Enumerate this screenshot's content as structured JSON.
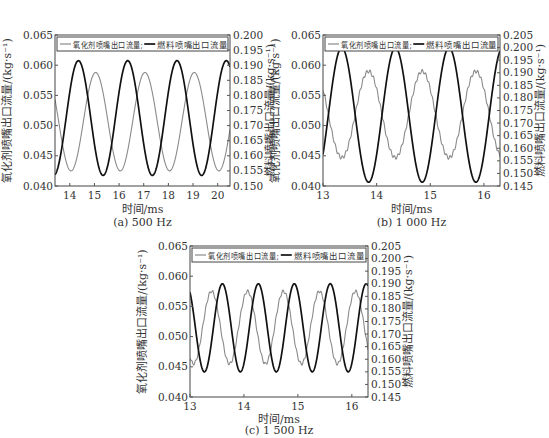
{
  "colors": {
    "oxidizer": "#8a8a8a",
    "fuel": "#111111",
    "axis": "#555555",
    "frame": "#444444"
  },
  "legend": {
    "oxidizer": "氧化剂喷嘴出口流量;",
    "fuel": "燃料喷嘴出口流量"
  },
  "axis_titles": {
    "x": "时间/ms",
    "y_left": "氧化剂喷嘴出口流量/(kg·s⁻¹)",
    "y_right": "燃料喷嘴出口流量/(kg·s⁻¹)"
  },
  "panels": [
    {
      "caption": "(a)  500 Hz"
    },
    {
      "caption": "(b)  1 000 Hz"
    },
    {
      "caption": "(c)  1 500 Hz"
    }
  ],
  "chart_data": [
    {
      "type": "line",
      "title": "(a) 500 Hz",
      "xlabel": "时间/ms",
      "ylabel": "氧化剂喷嘴出口流量/(kg·s⁻¹)",
      "ylabel_right": "燃料喷嘴出口流量/(kg·s⁻¹)",
      "xlim": [
        13.4,
        20.5
      ],
      "xticks": [
        14,
        15,
        16,
        17,
        18,
        19,
        20
      ],
      "ylim": [
        0.04,
        0.065
      ],
      "yticks": [
        0.04,
        0.045,
        0.05,
        0.055,
        0.06,
        0.065
      ],
      "ylim_right": [
        0.15,
        0.2
      ],
      "yticks_right": [
        0.15,
        0.155,
        0.16,
        0.165,
        0.17,
        0.175,
        0.18,
        0.185,
        0.19,
        0.195,
        0.2
      ],
      "legend_position": "top inside",
      "grid": false,
      "series": [
        {
          "name": "氧化剂喷嘴出口流量",
          "axis": "left",
          "frequency_hz": 500,
          "min": 0.0425,
          "max": 0.0588,
          "peaks_ms": [
            15.05,
            17.05,
            19.05
          ]
        },
        {
          "name": "燃料喷嘴出口流量",
          "axis": "right",
          "frequency_hz": 500,
          "min": 0.1535,
          "max": 0.1915,
          "peaks_ms": [
            14.35,
            16.35,
            18.35,
            20.35
          ]
        }
      ]
    },
    {
      "type": "line",
      "title": "(b) 1 000 Hz",
      "xlabel": "时间/ms",
      "ylabel": "氧化剂喷嘴出口流量/(kg·s⁻¹)",
      "ylabel_right": "燃料喷嘴出口流量/(kg·s⁻¹)",
      "xlim": [
        13.0,
        16.3
      ],
      "xticks": [
        13,
        14,
        15,
        16
      ],
      "ylim": [
        0.04,
        0.065
      ],
      "yticks": [
        0.04,
        0.045,
        0.05,
        0.055,
        0.06,
        0.065
      ],
      "ylim_right": [
        0.145,
        0.205
      ],
      "yticks_right": [
        0.145,
        0.15,
        0.155,
        0.16,
        0.165,
        0.17,
        0.175,
        0.18,
        0.185,
        0.19,
        0.195,
        0.2,
        0.205
      ],
      "legend_position": "top inside",
      "grid": false,
      "series": [
        {
          "name": "氧化剂喷嘴出口流量",
          "axis": "left",
          "frequency_hz": 1000,
          "min": 0.0447,
          "max": 0.059,
          "peaks_ms": [
            13.85,
            14.85,
            15.85
          ]
        },
        {
          "name": "燃料喷嘴出口流量",
          "axis": "right",
          "frequency_hz": 1000,
          "min": 0.1465,
          "max": 0.2,
          "peaks_ms": [
            13.35,
            14.35,
            15.35
          ]
        }
      ]
    },
    {
      "type": "line",
      "title": "(c) 1 500 Hz",
      "xlabel": "时间/ms",
      "ylabel": "氧化剂喷嘴出口流量/(kg·s⁻¹)",
      "ylabel_right": "燃料喷嘴出口流量/(kg·s⁻¹)",
      "xlim": [
        13.0,
        16.3
      ],
      "xticks": [
        13,
        14,
        15,
        16
      ],
      "ylim": [
        0.04,
        0.065
      ],
      "yticks": [
        0.04,
        0.045,
        0.05,
        0.055,
        0.06,
        0.065
      ],
      "ylim_right": [
        0.145,
        0.205
      ],
      "yticks_right": [
        0.145,
        0.15,
        0.155,
        0.16,
        0.165,
        0.17,
        0.175,
        0.18,
        0.185,
        0.19,
        0.195,
        0.2,
        0.205
      ],
      "legend_position": "top inside",
      "grid": false,
      "series": [
        {
          "name": "氧化剂喷嘴出口流量",
          "axis": "left",
          "frequency_hz": 1500,
          "min": 0.0455,
          "max": 0.0575,
          "peaks_ms": [
            13.4,
            14.07,
            14.73,
            15.4,
            16.07
          ]
        },
        {
          "name": "燃料喷嘴出口流量",
          "axis": "right",
          "frequency_hz": 1500,
          "min": 0.155,
          "max": 0.19,
          "peaks_ms": [
            13.6,
            14.27,
            14.93,
            15.6,
            16.27
          ]
        }
      ]
    }
  ]
}
